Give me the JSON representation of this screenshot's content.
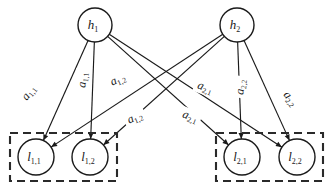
{
  "diagram": {
    "type": "node-link-graph",
    "background_color": "#ffffff",
    "stroke_color": "#1a1a1a",
    "dashed_box_color": "#2a2a2a",
    "hidden_nodes": [
      {
        "id": "h1",
        "base": "h",
        "sub": "1",
        "cx": 95,
        "cy": 25,
        "r": 17
      },
      {
        "id": "h2",
        "base": "h",
        "sub": "2",
        "cx": 237,
        "cy": 25,
        "r": 17
      }
    ],
    "leaf_nodes": [
      {
        "id": "l11",
        "base": "l",
        "sub": "1,1",
        "cx": 36,
        "cy": 157,
        "r": 18
      },
      {
        "id": "l12",
        "base": "l",
        "sub": "1,2",
        "cx": 90,
        "cy": 157,
        "r": 18
      },
      {
        "id": "l21",
        "base": "l",
        "sub": "2,1",
        "cx": 242,
        "cy": 157,
        "r": 18
      },
      {
        "id": "l22",
        "base": "l",
        "sub": "2,2",
        "cx": 297,
        "cy": 157,
        "r": 18
      }
    ],
    "group_boxes": [
      {
        "id": "group-1",
        "x": 10,
        "y": 133,
        "width": 107,
        "height": 48
      },
      {
        "id": "group-2",
        "x": 216,
        "y": 133,
        "width": 107,
        "height": 48
      }
    ],
    "edges": [
      {
        "id": "edge-h1-l11",
        "from": "h1",
        "to": "l11"
      },
      {
        "id": "edge-h1-l12",
        "from": "h1",
        "to": "l12"
      },
      {
        "id": "edge-h1-l21",
        "from": "h1",
        "to": "l21"
      },
      {
        "id": "edge-h1-l22",
        "from": "h1",
        "to": "l22"
      },
      {
        "id": "edge-h2-l11",
        "from": "h2",
        "to": "l11"
      },
      {
        "id": "edge-h2-l12",
        "from": "h2",
        "to": "l12"
      },
      {
        "id": "edge-h2-l21",
        "from": "h2",
        "to": "l21"
      },
      {
        "id": "edge-h2-l22",
        "from": "h2",
        "to": "l22"
      }
    ],
    "edge_labels": [
      {
        "id": "label-a11",
        "base": "a",
        "sub": "1,1",
        "x": 29,
        "y": 93,
        "rotate": -52
      },
      {
        "id": "label-a11b",
        "base": "a",
        "sub": "1,1",
        "x": 83,
        "y": 80,
        "rotate": -84
      },
      {
        "id": "label-a12",
        "base": "a",
        "sub": "1,2",
        "x": 118,
        "y": 80,
        "rotate": -24
      },
      {
        "id": "label-a12b",
        "base": "a",
        "sub": "1,2",
        "x": 135,
        "y": 118,
        "rotate": -24
      },
      {
        "id": "label-a21",
        "base": "a",
        "sub": "2,1",
        "x": 205,
        "y": 88,
        "rotate": 21
      },
      {
        "id": "label-a21b",
        "base": "a",
        "sub": "2,1",
        "x": 190,
        "y": 117,
        "rotate": 21
      },
      {
        "id": "label-a22",
        "base": "a",
        "sub": "2,2",
        "x": 241,
        "y": 87,
        "rotate": -84
      },
      {
        "id": "label-a22b",
        "base": "a",
        "sub": "2,2",
        "x": 290,
        "y": 99,
        "rotate": 52
      }
    ]
  }
}
